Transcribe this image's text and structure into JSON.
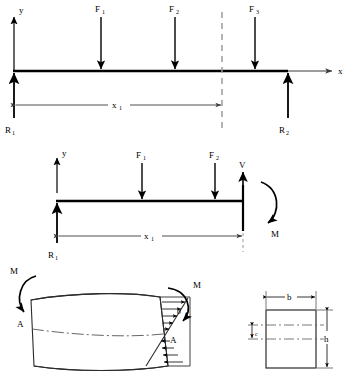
{
  "figure": {
    "stroke_color": "#000000",
    "background": "#ffffff",
    "dashed_color": "#9a9a9a",
    "dimension_color": "#4a4a4a"
  },
  "panel_beam": {
    "name": "full beam free body diagram",
    "axis_y_label": "y",
    "axis_x_label": "x",
    "loads": [
      {
        "label": "F",
        "sub": "1",
        "x": 101
      },
      {
        "label": "F",
        "sub": "2",
        "x": 175
      },
      {
        "label": "F",
        "sub": "3",
        "x": 255
      }
    ],
    "reactions": [
      {
        "label": "R",
        "sub": "1",
        "x": 14
      },
      {
        "label": "R",
        "sub": "2",
        "x": 288
      }
    ],
    "dimension": {
      "label": "x",
      "sub": "1",
      "from": 14,
      "to": 222
    },
    "section_cut_x": 222
  },
  "panel_section": {
    "name": "cut section free body diagram",
    "axis_y_label": "y",
    "loads": [
      {
        "label": "F",
        "sub": "1",
        "x": 142
      },
      {
        "label": "F",
        "sub": "2",
        "x": 215
      }
    ],
    "reactions": [
      {
        "label": "R",
        "sub": "1",
        "x": 57
      }
    ],
    "shear_label": "V",
    "moment_label": "M",
    "dimension": {
      "label": "x",
      "sub": "1",
      "from": 57,
      "to": 243
    }
  },
  "panel_bending": {
    "name": "bent beam element with stress distribution",
    "moment_left_label": "M",
    "moment_right_label": "M",
    "point_left_label": "A",
    "point_right_label": "A",
    "stress_label": "σ",
    "neutral_axis": "dash-dot centerline"
  },
  "panel_cross_section": {
    "name": "rectangular cross section",
    "width_label": "b",
    "height_label": "h",
    "centroid_label": "c"
  }
}
